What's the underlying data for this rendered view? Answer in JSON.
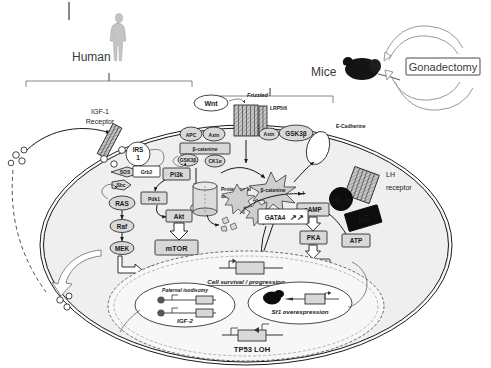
{
  "figure": {
    "species_left": "Human",
    "species_right": "Mice",
    "treatment_box": "Gonadectomy"
  },
  "receptors": {
    "igf1r": "IGF-1\nReceptor",
    "igf1r_line1": "IGF-1",
    "igf1r_line2": "Receptor",
    "wnt": "Wnt",
    "frizzled": "Frizzled",
    "lrp": "LRP5/6",
    "ecadherin": "E-Cadherine",
    "lh_line1": "LH",
    "lh_line2": "receptor"
  },
  "mapk_cascade": {
    "irs1_l1": "IRS",
    "irs1_l2": "1",
    "sos": "SOS",
    "grb2": "Grb2",
    "shc": "Shc",
    "ras": "RAS",
    "raf": "Raf",
    "mek": "MEK",
    "erk": "ERK"
  },
  "pi3k_cascade": {
    "pi3k": "Pi3k",
    "pdk1": "Pdk1",
    "akt": "Akt",
    "mtor": "mTOR"
  },
  "wnt_cascade": {
    "apc": "APC",
    "axin": "Axin",
    "axin2": "Axin",
    "bcatenin": "β-catenine",
    "gsk3b": "GSK3β",
    "gsk3b_small": "GSK3β",
    "ck1a": "CK1α",
    "bcat_free": "β-catenine",
    "proteasome_l1": "Proteasomal",
    "proteasome_l2": "degradation"
  },
  "camp_cascade": {
    "gsa": "G",
    "gsa_sub": "s",
    "gsa_alpha": "α",
    "ac": "AC",
    "atp": "ATP",
    "camp": "cAMP",
    "pka": "PKA",
    "creb": "CREB",
    "gata4": "GATA4",
    "gata4_arrows": "↗↗",
    "plus": "+"
  },
  "nucleus": {
    "cell_survival": "Cell survival / progression",
    "isodisomy": "Paternal isodisomy",
    "igf2": "IGF-2",
    "sf1": "Sf1 overexpression",
    "sf1_marks": "ˮ",
    "tp53": "TP53 LOH"
  },
  "colors": {
    "node_fill": "#d8d8d8",
    "node_dark": "#0d0d0d",
    "cytoplasm": "#efefef",
    "nucleus": "#f7f7f7",
    "stroke": "#1a1a1a"
  }
}
